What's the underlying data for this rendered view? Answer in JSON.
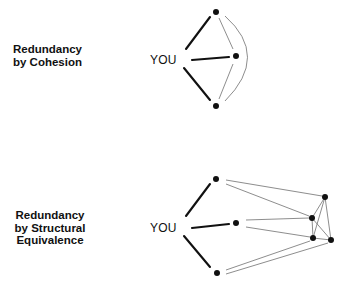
{
  "diagrams": [
    {
      "id": "cohesion",
      "label_lines": [
        "Redundancy",
        "by Cohesion"
      ],
      "ego_label": "YOU",
      "contacts": 3,
      "contact_ties": "all contacts directly connected to each other"
    },
    {
      "id": "structural_equivalence",
      "label_lines": [
        "Redundancy",
        "by Structural",
        "Equivalence"
      ],
      "ego_label": "YOU",
      "contacts": 3,
      "third_party_cluster_size": 4,
      "contact_ties": "contacts not connected to each other but linked to the same third-party cluster"
    }
  ],
  "colors": {
    "strong_tie": "#111111",
    "weak_tie": "#808080",
    "node": "#111111",
    "background": "#ffffff"
  }
}
